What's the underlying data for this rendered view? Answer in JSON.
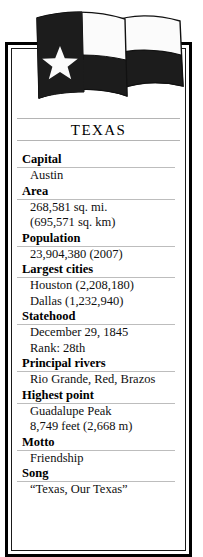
{
  "title": "TEXAS",
  "flag": {
    "front_flag_name": "texas-state-flag",
    "back_flag_name": "second-flag",
    "star_name": "lone-star",
    "colors": {
      "dark": "#1c1c1c",
      "light": "#fbfbfb",
      "outline": "#000000"
    }
  },
  "colors": {
    "frame": "#000000",
    "rule": "#b4b4b4",
    "text": "#000000",
    "background": "#ffffff"
  },
  "facts": [
    {
      "label": "Capital",
      "values": [
        "Austin"
      ]
    },
    {
      "label": "Area",
      "values": [
        "268,581 sq. mi.",
        "(695,571 sq. km)"
      ]
    },
    {
      "label": "Population",
      "values": [
        "23,904,380 (2007)"
      ]
    },
    {
      "label": "Largest cities",
      "values": [
        "Houston (2,208,180)",
        "Dallas (1,232,940)"
      ]
    },
    {
      "label": "Statehood",
      "values": [
        "December 29, 1845",
        "Rank: 28th"
      ]
    },
    {
      "label": "Principal rivers",
      "values": [
        "Rio Grande, Red, Brazos"
      ]
    },
    {
      "label": "Highest point",
      "values": [
        "Guadalupe Peak",
        "8,749 feet (2,668 m)"
      ]
    },
    {
      "label": "Motto",
      "values": [
        "Friendship"
      ]
    },
    {
      "label": "Song",
      "values": [
        "“Texas, Our Texas”"
      ]
    }
  ]
}
